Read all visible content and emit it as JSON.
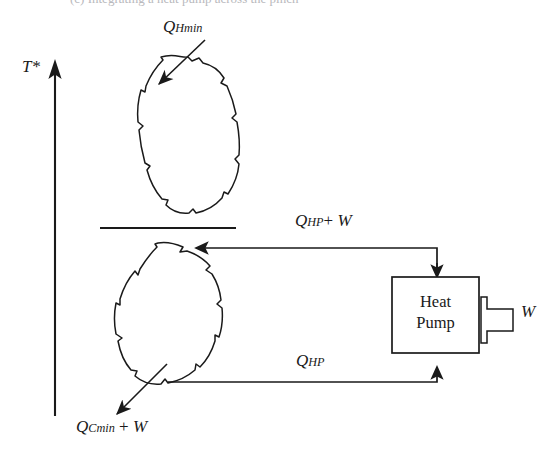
{
  "figure": {
    "background_color": "#ffffff",
    "ink_color": "#1a1a1a",
    "width": 556,
    "height": 454
  },
  "caption": {
    "clipped_top_text": "(c) Integrating a heat pump across the pinch"
  },
  "axis": {
    "label": "T*",
    "name": "shifted-temperature-axis",
    "direction": "up"
  },
  "streams": {
    "hot_blob_label": "Q",
    "pinch_line_name": "pinch-divider-line"
  },
  "labels": {
    "q_hmin": {
      "symbol": "Q",
      "subscript": "Hmin",
      "full": "QHmin"
    },
    "q_hp_plus_w": {
      "symbol": "Q",
      "subscript": "HP",
      "operator": "+",
      "term": "W",
      "full": "QHP + W"
    },
    "q_hp": {
      "symbol": "Q",
      "subscript": "HP",
      "full": "QHP"
    },
    "q_cmin_plus_w": {
      "symbol": "Q",
      "subscript": "Cmin",
      "operator": "+",
      "term": "W",
      "full": "QCmin + W"
    },
    "work_input": {
      "symbol": "W",
      "full": "W"
    }
  },
  "heat_pump": {
    "line1": "Heat",
    "line2": "Pump",
    "name": "heat-pump-unit"
  },
  "arrows": {
    "q_hmin_into_hot_blob": "arrow-into-hot-composite",
    "q_cmin_out_of_cold_blob": "arrow-out-of-cold-composite",
    "heat_out_to_hot_blob": "arrow-heat-rejected-above-pinch",
    "heat_in_from_cold_blob": "arrow-heat-absorbed-below-pinch",
    "work_into_pump": "block-arrow-work-input"
  }
}
